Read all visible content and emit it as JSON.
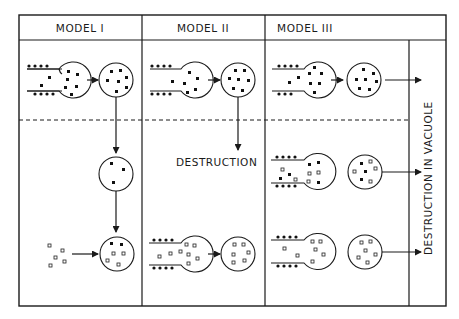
{
  "figure": {
    "columns": [
      {
        "label": "MODEL I"
      },
      {
        "label": "MODEL II"
      },
      {
        "label": "MODEL III"
      }
    ],
    "annotations": {
      "destruction": "DESTRUCTION",
      "destruction_in_vacuole": "DESTRUCTION IN VACUOLE"
    },
    "legend_semantics": {
      "filled-square": "solid particle",
      "open-square": "open particle",
      "bead-row": "membrane-bound particles"
    }
  }
}
